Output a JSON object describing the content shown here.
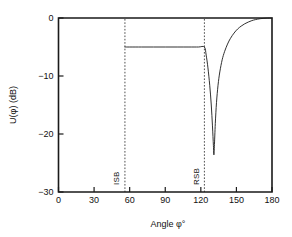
{
  "chart_data": {
    "type": "line",
    "title": "",
    "subtitle": "",
    "xlabel": "Angle  φ°",
    "ylabel": "U(φ)   (dB)",
    "xlim": [
      0,
      180
    ],
    "ylim": [
      -30,
      0
    ],
    "grid": false,
    "legend": null,
    "x_ticks": [
      0,
      30,
      60,
      90,
      120,
      150,
      180
    ],
    "x_tick_labels": [
      "0",
      "30",
      "60",
      "90",
      "120",
      "150",
      "180"
    ],
    "y_ticks": [
      0,
      -10,
      -20,
      -30
    ],
    "y_tick_labels": [
      "0",
      "−10",
      "−20",
      "−30"
    ],
    "series": [
      {
        "name": "U(φ)",
        "color": "#1a1a1a",
        "style": "solid",
        "x": [
          56,
          60,
          70,
          80,
          90,
          100,
          110,
          118,
          123,
          124.5,
          126,
          127.5,
          128.8,
          129.8,
          130.6,
          131.0,
          131.4,
          132.2,
          133.2,
          134.5,
          136,
          138,
          140,
          142.5,
          145,
          148,
          151,
          154,
          157,
          160,
          163,
          166,
          170,
          175,
          180
        ],
        "y": [
          -5.0,
          -5.0,
          -5.0,
          -5.0,
          -5.0,
          -5.0,
          -5.0,
          -5.0,
          -5.0,
          -6.4,
          -8.6,
          -11.6,
          -15.0,
          -18.6,
          -22.0,
          -23.6,
          -22.2,
          -18.2,
          -14.6,
          -11.6,
          -9.3,
          -7.2,
          -5.8,
          -4.5,
          -3.5,
          -2.6,
          -1.9,
          -1.4,
          -1.0,
          -0.7,
          -0.45,
          -0.28,
          -0.12,
          -0.03,
          0.0
        ]
      }
    ],
    "annotations": [
      {
        "name": "ISB",
        "label": "ISB",
        "x": 56,
        "type": "vertical-dashed-line",
        "label_rotation": -90
      },
      {
        "name": "RSB",
        "label": "RSB",
        "x": 123,
        "type": "vertical-dashed-line",
        "label_rotation": -90
      }
    ],
    "notes": {
      "plateau_level_db": -5.0,
      "null_depth_db": -23.6,
      "null_angle_deg": 131,
      "curve_start_deg": 56
    }
  },
  "colors": {
    "background": "#ffffff",
    "axis": "#1a1a1a",
    "curve": "#1a1a1a",
    "marker": "#3a3a3a"
  }
}
